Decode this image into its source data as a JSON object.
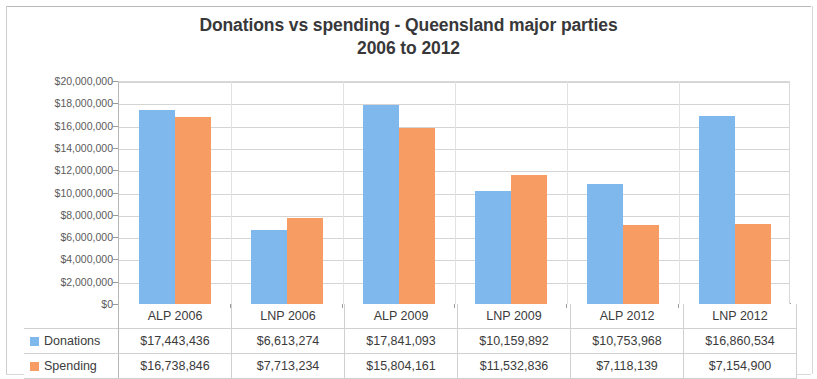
{
  "chart_data": {
    "type": "bar",
    "title": "Donations vs spending - Queensland major parties 2006 to 2012",
    "title_line1": "Donations vs spending - Queensland major parties",
    "title_line2": "2006 to 2012",
    "xlabel": "",
    "ylabel": "",
    "ylim": [
      0,
      20000000
    ],
    "ytick_step": 2000000,
    "grid": true,
    "legend_position": "table",
    "categories": [
      "ALP 2006",
      "LNP 2006",
      "ALP 2009",
      "LNP 2009",
      "ALP 2012",
      "LNP 2012"
    ],
    "ytick_labels": [
      "$20,000,000",
      "$18,000,000",
      "$16,000,000",
      "$14,000,000",
      "$12,000,000",
      "$10,000,000",
      "$8,000,000",
      "$6,000,000",
      "$4,000,000",
      "$2,000,000",
      "$0"
    ],
    "ytick_values": [
      20000000,
      18000000,
      16000000,
      14000000,
      12000000,
      10000000,
      8000000,
      6000000,
      4000000,
      2000000,
      0
    ],
    "series": [
      {
        "name": "Donations",
        "color": "#7fb8ec",
        "values": [
          17443436,
          6613274,
          17841093,
          10159892,
          10753968,
          16860534
        ],
        "labels": [
          "$17,443,436",
          "$6,613,274",
          "$17,841,093",
          "$10,159,892",
          "$10,753,968",
          "$16,860,534"
        ]
      },
      {
        "name": "Spending",
        "color": "#f79c63",
        "values": [
          16738846,
          7713234,
          15804161,
          11532836,
          7118139,
          7154900
        ],
        "labels": [
          "$16,738,846",
          "$7,713,234",
          "$15,804,161",
          "$11,532,836",
          "$7,118,139",
          "$7,154,900"
        ]
      }
    ]
  },
  "data_table": {
    "row_labels": [
      "Donations",
      "Spending"
    ],
    "swatch_icons": [
      "legend-swatch-donations-icon",
      "legend-swatch-spending-icon"
    ]
  }
}
